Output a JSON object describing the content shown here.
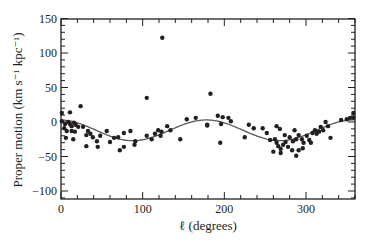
{
  "chart_data": {
    "type": "scatter",
    "title": "",
    "xlabel": "ℓ (degrees)",
    "ylabel": "Proper motion (km s⁻¹ kpc⁻¹)",
    "xlim": [
      0,
      360
    ],
    "ylim": [
      -111,
      150
    ],
    "xticks": [
      0,
      100,
      200,
      300
    ],
    "xminor_step": 20,
    "yticks": [
      -100,
      -50,
      0,
      50,
      100,
      150
    ],
    "yminor_step": 10,
    "grid": false,
    "legend": null,
    "series": [
      {
        "name": "observed stars",
        "kind": "scatter",
        "marker": "filled-circle",
        "color": "#231f20",
        "points": [
          [
            1,
            13
          ],
          [
            11,
            14
          ],
          [
            24,
            23
          ],
          [
            1,
            1
          ],
          [
            5,
            -3
          ],
          [
            9,
            0
          ],
          [
            11,
            -3
          ],
          [
            13,
            -6
          ],
          [
            16,
            -1
          ],
          [
            18,
            -4
          ],
          [
            21,
            -7
          ],
          [
            4,
            -9
          ],
          [
            7,
            -13
          ],
          [
            13,
            -13
          ],
          [
            17,
            -14
          ],
          [
            6,
            -23
          ],
          [
            15,
            -25
          ],
          [
            27,
            -7
          ],
          [
            33,
            -13
          ],
          [
            31,
            -19
          ],
          [
            36,
            -17
          ],
          [
            39,
            -22
          ],
          [
            31,
            -35
          ],
          [
            44,
            -28
          ],
          [
            48,
            -20
          ],
          [
            56,
            -13
          ],
          [
            60,
            -29
          ],
          [
            45,
            -36
          ],
          [
            65,
            -23
          ],
          [
            70,
            -22
          ],
          [
            77,
            -16
          ],
          [
            72,
            -41
          ],
          [
            77,
            -36
          ],
          [
            105,
            35
          ],
          [
            124,
            122
          ],
          [
            85,
            -13
          ],
          [
            91,
            -28
          ],
          [
            90,
            -33
          ],
          [
            105,
            -20
          ],
          [
            111,
            -25
          ],
          [
            115,
            -17
          ],
          [
            119,
            -12
          ],
          [
            123,
            -14
          ],
          [
            122,
            -20
          ],
          [
            130,
            -6
          ],
          [
            134,
            -12
          ],
          [
            146,
            -25
          ],
          [
            154,
            4
          ],
          [
            165,
            6
          ],
          [
            179,
            -4
          ],
          [
            183,
            41
          ],
          [
            192,
            9
          ],
          [
            198,
            7
          ],
          [
            205,
            6
          ],
          [
            208,
            1
          ],
          [
            196,
            -3
          ],
          [
            195,
            -30
          ],
          [
            179,
            -5
          ],
          [
            230,
            -4
          ],
          [
            236,
            -9
          ],
          [
            225,
            -22
          ],
          [
            252,
            -16
          ],
          [
            256,
            -26
          ],
          [
            262,
            -25
          ],
          [
            264,
            -30
          ],
          [
            266,
            -35
          ],
          [
            269,
            -39
          ],
          [
            272,
            -33
          ],
          [
            274,
            -19
          ],
          [
            275,
            -29
          ],
          [
            278,
            -36
          ],
          [
            283,
            -41
          ],
          [
            288,
            -49
          ],
          [
            284,
            -28
          ],
          [
            288,
            -25
          ],
          [
            291,
            -19
          ],
          [
            295,
            -25
          ],
          [
            297,
            -30
          ],
          [
            301,
            -20
          ],
          [
            304,
            -26
          ],
          [
            306,
            -30
          ],
          [
            308,
            -16
          ],
          [
            311,
            -12
          ],
          [
            313,
            -17
          ],
          [
            316,
            -14
          ],
          [
            318,
            -7
          ],
          [
            321,
            -12
          ],
          [
            324,
            0
          ],
          [
            327,
            -6
          ],
          [
            330,
            -23
          ],
          [
            291,
            -41
          ],
          [
            296,
            -38
          ],
          [
            269,
            -45
          ],
          [
            280,
            -22
          ],
          [
            343,
            3
          ],
          [
            350,
            4
          ],
          [
            354,
            6
          ],
          [
            358,
            6
          ],
          [
            358,
            13
          ],
          [
            286,
            -12
          ],
          [
            268,
            -10
          ],
          [
            260,
            -43
          ],
          [
            247,
            -9
          ],
          [
            264,
            -6
          ]
        ]
      },
      {
        "name": "model fit",
        "kind": "line",
        "color": "#5a5758",
        "formula": "v = -12 + 15*cos(2*(l - 178°))",
        "x": [
          0,
          20,
          40,
          60,
          80,
          100,
          120,
          140,
          160,
          180,
          200,
          220,
          240,
          260,
          280,
          300,
          320,
          340,
          360
        ],
        "values": [
          3,
          1,
          -6,
          -15,
          -24,
          -27,
          -22,
          -13,
          -3,
          3,
          1,
          -6,
          -16,
          -24,
          -27,
          -22,
          -12,
          -3,
          3
        ]
      }
    ]
  }
}
